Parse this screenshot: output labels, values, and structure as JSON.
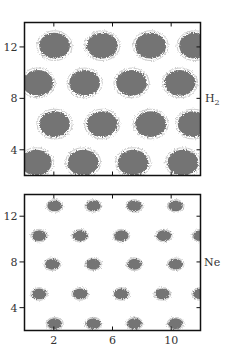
{
  "figure": {
    "colors": {
      "trajectory": "#6e6e6e",
      "frame": "#111111",
      "text": "#333333"
    }
  },
  "chart_data": [
    {
      "type": "scatter",
      "title": "",
      "panel_label": "H₂",
      "panel_label_base": "H",
      "panel_label_sub": "2",
      "xlabel": "",
      "ylabel": "",
      "xlim": [
        0,
        12
      ],
      "ylim": [
        2,
        13.9
      ],
      "xticks": [
        2,
        6,
        10
      ],
      "show_xtick_labels": false,
      "yticks": [
        4,
        8,
        12
      ],
      "ytick_labels": [
        "4",
        "8",
        "12"
      ],
      "grid": false,
      "marker": "diffuse trajectory cloud",
      "cloud_radius": 1.05,
      "points": [
        [
          2.05,
          12.1
        ],
        [
          5.3,
          12.1
        ],
        [
          8.6,
          12.1
        ],
        [
          11.6,
          12.1
        ],
        [
          0.9,
          9.2
        ],
        [
          4.1,
          9.2
        ],
        [
          7.3,
          9.2
        ],
        [
          10.6,
          9.2
        ],
        [
          2.05,
          6.0
        ],
        [
          5.3,
          6.0
        ],
        [
          8.6,
          6.0
        ],
        [
          11.5,
          6.0
        ],
        [
          0.8,
          3.0
        ],
        [
          4.0,
          3.0
        ],
        [
          7.4,
          3.0
        ],
        [
          10.8,
          3.0
        ]
      ]
    },
    {
      "type": "scatter",
      "title": "",
      "panel_label": "Ne",
      "xlabel": "",
      "ylabel": "",
      "xlim": [
        0,
        12
      ],
      "ylim": [
        2,
        13.9
      ],
      "xticks": [
        2,
        6,
        10
      ],
      "xtick_labels": [
        "2",
        "6",
        "10"
      ],
      "show_xtick_labels": true,
      "yticks": [
        4,
        8,
        12
      ],
      "ytick_labels": [
        "4",
        "8",
        "12"
      ],
      "grid": false,
      "marker": "compact trajectory cloud",
      "cloud_radius": 0.5,
      "points": [
        [
          2.05,
          12.9
        ],
        [
          4.7,
          12.9
        ],
        [
          7.5,
          12.9
        ],
        [
          10.3,
          12.9
        ],
        [
          1.0,
          10.3
        ],
        [
          3.8,
          10.3
        ],
        [
          6.6,
          10.3
        ],
        [
          9.5,
          10.3
        ],
        [
          12.0,
          10.3
        ],
        [
          1.9,
          7.8
        ],
        [
          4.7,
          7.8
        ],
        [
          7.5,
          7.8
        ],
        [
          10.3,
          7.8
        ],
        [
          1.0,
          5.2
        ],
        [
          3.8,
          5.2
        ],
        [
          6.6,
          5.2
        ],
        [
          9.4,
          5.2
        ],
        [
          12.0,
          5.2
        ],
        [
          2.05,
          2.6
        ],
        [
          4.7,
          2.6
        ],
        [
          7.5,
          2.6
        ],
        [
          10.3,
          2.6
        ]
      ]
    }
  ]
}
